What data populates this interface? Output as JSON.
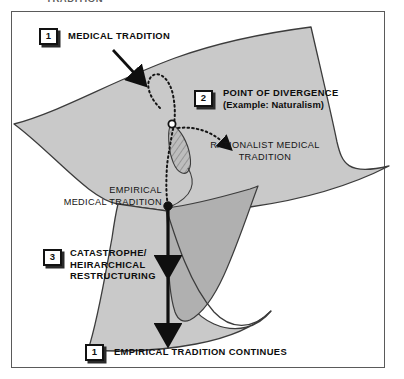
{
  "page": {
    "top_clipped_text": "TRADITION",
    "background_color": "#ffffff",
    "frame_color": "#5a5a5a"
  },
  "diagram": {
    "type": "cusp-catastrophe-surface",
    "surface_fill": "#c9c9c9",
    "fold_fill": "#b0b0b0",
    "outline_color": "#3c3c3c",
    "markers": {
      "divergence_node": "open-circle",
      "empirical_node": "filled-circle"
    }
  },
  "labels": {
    "step1": {
      "number": "1",
      "text": "MEDICAL TRADITION"
    },
    "step2": {
      "number": "2",
      "title": "POINT OF DIVERGENCE",
      "subtitle": "(Example: Naturalism)"
    },
    "step3": {
      "number": "3",
      "text": "CATASTROPHE/\nHEIRARCHICAL\nRESTRUCTURING"
    },
    "step4": {
      "number": "1",
      "text": "EMPIRICAL TRADITION CONTINUES"
    },
    "rationalist": "RATIONALIST MEDICAL\nTRADITION",
    "empirical": "EMPIRICAL\nMEDICAL TRADITION"
  }
}
